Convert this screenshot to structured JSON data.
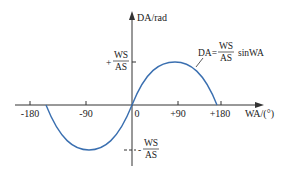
{
  "diagram": {
    "title": "",
    "y_axis_label": "DA/rad",
    "x_axis_label": "WA/(°)",
    "x_ticks": [
      "-180",
      "-90",
      "0",
      "+90",
      "+180"
    ],
    "y_marks": {
      "positive": {
        "sign": "+",
        "numerator": "WS",
        "denominator": "AS"
      },
      "negative": {
        "sign": "-",
        "numerator": "WS",
        "denominator": "AS"
      }
    },
    "equation": {
      "lhs": "DA=",
      "numerator": "WS",
      "denominator": "AS",
      "rhs": "sinWA"
    },
    "curve_color": "#3a6fb0",
    "axis_color": "#333333"
  }
}
